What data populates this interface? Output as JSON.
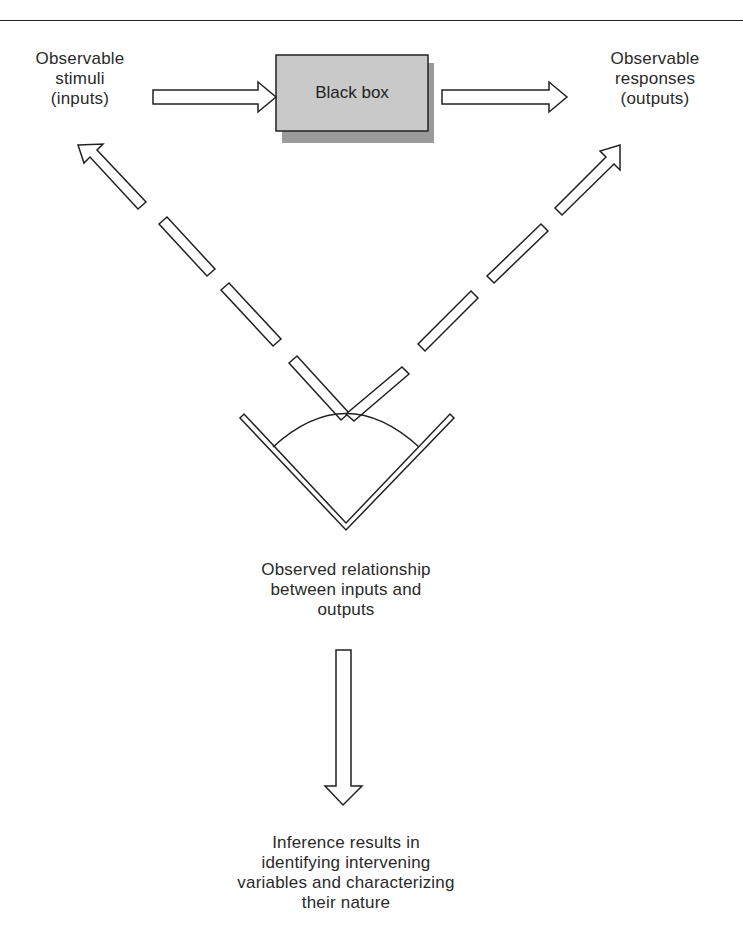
{
  "diagram": {
    "black_box": {
      "label": "Black box",
      "fill": "#c8c8c8",
      "shadow": "#9a9a9a"
    },
    "inputs": {
      "lines": [
        "Observable",
        "stimuli",
        "(inputs)"
      ]
    },
    "outputs": {
      "lines": [
        "Observable",
        "responses",
        "(outputs)"
      ]
    },
    "observed": {
      "lines": [
        "Observed relationship",
        "between inputs and",
        "outputs"
      ]
    },
    "inference": {
      "lines": [
        "Inference results in",
        "identifying intervening",
        "variables and characterizing",
        "their nature"
      ]
    },
    "arrows": [
      {
        "from": "inputs",
        "to": "black_box",
        "style": "hollow"
      },
      {
        "from": "black_box",
        "to": "outputs",
        "style": "hollow"
      },
      {
        "from": "observed",
        "to": "inputs",
        "style": "hollow-dashed"
      },
      {
        "from": "observed",
        "to": "outputs",
        "style": "hollow-dashed"
      },
      {
        "from": "observed",
        "to": "inference",
        "style": "hollow"
      }
    ]
  }
}
